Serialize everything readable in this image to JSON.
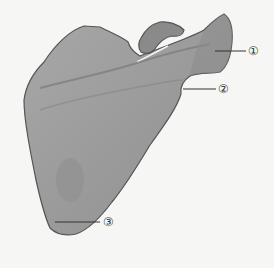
{
  "figure": {
    "fill_color": "#9a9a9a",
    "outline_color": "#555555",
    "background": "#f6f6f4",
    "labels": [
      {
        "id": "1",
        "text": "①",
        "x": 248,
        "y": 45,
        "line_from": [
          215,
          51
        ],
        "line_to": [
          246,
          51
        ]
      },
      {
        "id": "2",
        "text": "②",
        "x": 218,
        "y": 83,
        "line_from": [
          183,
          89
        ],
        "line_to": [
          216,
          89
        ]
      },
      {
        "id": "3",
        "text": "③",
        "x": 103,
        "y": 217,
        "line_from": [
          55,
          222
        ],
        "line_to": [
          100,
          222
        ]
      }
    ]
  }
}
